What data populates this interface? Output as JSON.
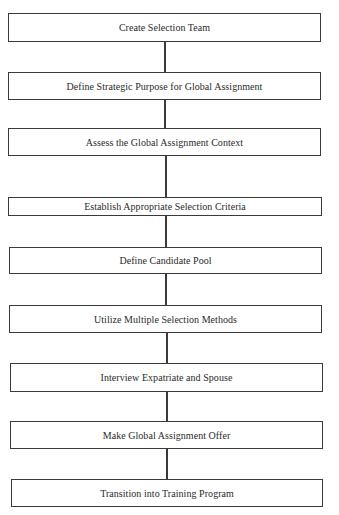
{
  "diagram": {
    "type": "vertical-flowchart",
    "steps": [
      {
        "label": "Create Selection Team"
      },
      {
        "label": "Define Strategic Purpose for Global Assignment"
      },
      {
        "label": "Assess the Global Assignment Context"
      },
      {
        "label": "Establish Appropriate Selection Criteria"
      },
      {
        "label": "Define Candidate Pool"
      },
      {
        "label": "Utilize Multiple Selection Methods"
      },
      {
        "label": "Interview Expatriate and Spouse"
      },
      {
        "label": "Make Global Assignment Offer"
      },
      {
        "label": "Transition into Training Program"
      }
    ],
    "colors": {
      "line": "#3a3a3a",
      "text": "#2a2a2a",
      "background": "#ffffff"
    }
  }
}
